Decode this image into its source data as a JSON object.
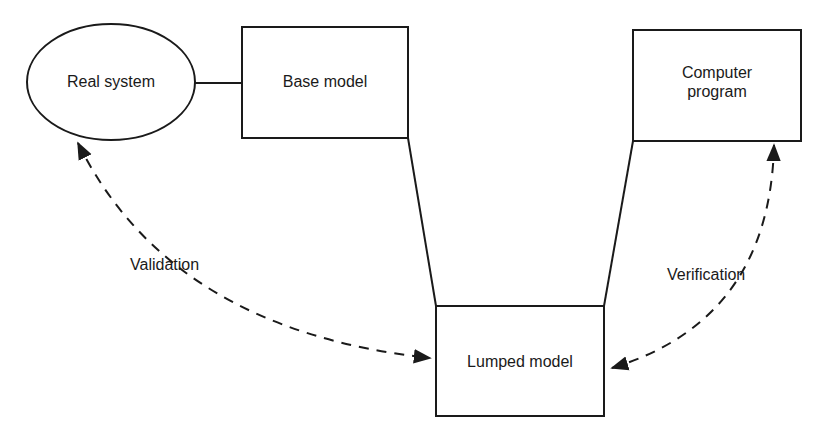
{
  "diagram": {
    "nodes": {
      "real_system": {
        "label": "Real system",
        "shape": "ellipse"
      },
      "base_model": {
        "label": "Base model",
        "shape": "rectangle"
      },
      "computer_program": {
        "label_line1": "Computer",
        "label_line2": "program",
        "shape": "rectangle"
      },
      "lumped_model": {
        "label": "Lumped model",
        "shape": "rectangle"
      }
    },
    "edges": {
      "validation": {
        "label": "Validation",
        "from": "Real system",
        "to": "Lumped model",
        "style": "dashed",
        "direction": "bidirectional"
      },
      "verification": {
        "label": "Verification",
        "from": "Computer program",
        "to": "Lumped model",
        "style": "dashed",
        "direction": "bidirectional"
      }
    },
    "colors": {
      "stroke": "#1a1a1a",
      "background": "#ffffff"
    }
  }
}
